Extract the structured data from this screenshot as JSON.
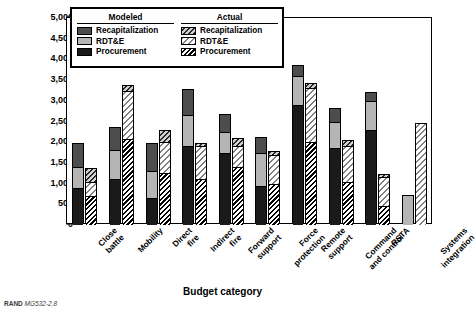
{
  "axes": {
    "ylabel": "Budget (millions of 2006 $)",
    "xlabel": "Budget category",
    "yticks": [
      "5,000",
      "4,500",
      "4,000",
      "3,500",
      "3,000",
      "2,500",
      "2,000",
      "1,500",
      "1,000",
      "500",
      "0"
    ]
  },
  "legend": {
    "groups": [
      {
        "title": "Modeled",
        "items": [
          {
            "label": "Recapitalization",
            "swatch": "recap"
          },
          {
            "label": "RDT&E",
            "swatch": "rdte"
          },
          {
            "label": "Procurement",
            "swatch": "proc"
          }
        ]
      },
      {
        "title": "Actual",
        "items": [
          {
            "label": "Recapitalization",
            "swatch": "hrecap"
          },
          {
            "label": "RDT&E",
            "swatch": "hrdte"
          },
          {
            "label": "Procurement",
            "swatch": "hproc"
          }
        ]
      }
    ]
  },
  "footer": {
    "rand": "RAND",
    "code": "MG532-2.8"
  },
  "chart_data": {
    "type": "bar",
    "title": "",
    "xlabel": "Budget category",
    "ylabel": "Budget (millions of 2006 $)",
    "ylim": [
      0,
      5000
    ],
    "ytick_step": 500,
    "grid": false,
    "legend_position": "top-left-inset",
    "stacked": true,
    "categories": [
      "Close battle",
      "Mobility",
      "Direct fire",
      "Indirect fire",
      "Forward support",
      "Force protection",
      "Remote support",
      "Command and control",
      "RSTA",
      "Systems integration"
    ],
    "series": [
      {
        "name": "Modeled Procurement",
        "values": [
          900,
          1100,
          650,
          1900,
          1750,
          950,
          2900,
          1850,
          2300,
          0
        ]
      },
      {
        "name": "Modeled RDT&E",
        "values": [
          500,
          700,
          650,
          750,
          500,
          800,
          700,
          650,
          700,
          700
        ]
      },
      {
        "name": "Modeled Recapitalization",
        "values": [
          550,
          550,
          650,
          600,
          400,
          350,
          250,
          300,
          200,
          0
        ]
      },
      {
        "name": "Actual Procurement",
        "values": [
          700,
          2080,
          1250,
          1100,
          1400,
          1000,
          2000,
          1050,
          450,
          0
        ]
      },
      {
        "name": "Actual RDT&E",
        "values": [
          350,
          1150,
          750,
          800,
          500,
          700,
          1300,
          850,
          700,
          2450
        ]
      },
      {
        "name": "Actual Recapitalization",
        "values": [
          300,
          130,
          280,
          50,
          180,
          60,
          100,
          120,
          50,
          0
        ]
      }
    ],
    "modeled_totals": [
      1950,
      2350,
      1950,
      3250,
      2650,
      2100,
      3850,
      2800,
      3200,
      700
    ],
    "actual_totals": [
      1350,
      3360,
      2280,
      1950,
      2080,
      1760,
      3400,
      2020,
      1200,
      2450
    ]
  }
}
